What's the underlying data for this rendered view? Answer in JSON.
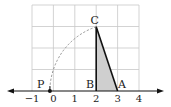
{
  "diagram": {
    "type": "number-line-construction",
    "grid": {
      "x_min": -1,
      "x_max": 4,
      "y_min": 0,
      "y_max": 4,
      "line_color": "#c8c8c8"
    },
    "axis": {
      "tick_labels": [
        "−1",
        "0",
        "1",
        "2",
        "3",
        "4"
      ],
      "tick_values": [
        -1,
        0,
        1,
        2,
        3,
        4
      ],
      "color": "#111111"
    },
    "points": {
      "P": {
        "label": "P",
        "x": -0.16,
        "y": 0
      },
      "B": {
        "label": "B",
        "x": 2,
        "y": 0
      },
      "A": {
        "label": "A",
        "x": 3,
        "y": 0
      },
      "C": {
        "label": "C",
        "x": 2,
        "y": 3
      }
    },
    "triangle": {
      "vertices": [
        "A",
        "B",
        "C"
      ],
      "fill": "#cfcfcf",
      "stroke": "#111111"
    },
    "arc": {
      "center": "A",
      "from": "C",
      "to": "P",
      "style": "dashed",
      "color": "#888888"
    }
  }
}
